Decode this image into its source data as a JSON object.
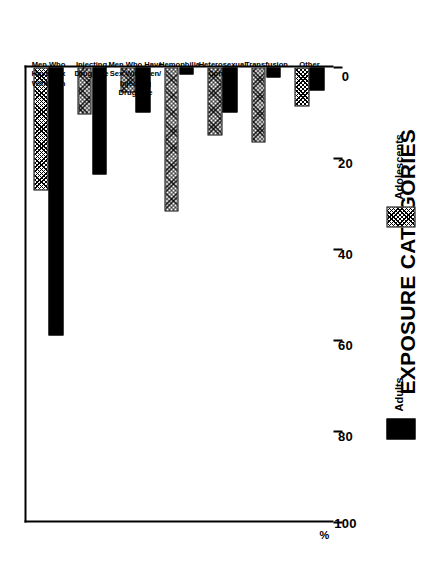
{
  "chart_data": {
    "type": "bar",
    "orientation": "horizontal",
    "title": "",
    "xlabel": "EXPOSURE CATEGORIES",
    "ylabel": "%",
    "ylim": [
      0,
      100
    ],
    "yticks": [
      0,
      20,
      40,
      60,
      80,
      100
    ],
    "ytick_labels": [
      "0",
      "20",
      "40",
      "60",
      "80",
      "100"
    ],
    "grid": false,
    "legend_position": "below-axis",
    "categories": [
      "Men Who\nHave Sex\nWith Men",
      "Injecting\nDrug Use",
      "Men Who Have\nSex With Men/\nInjecting\nDrug Use",
      "Hemophilia",
      "Heterosexual\nContact",
      "Transfusion",
      "Other"
    ],
    "category_lines": [
      [
        "Men Who",
        "Have Sex",
        "With Men"
      ],
      [
        "Injecting",
        "Drug Use"
      ],
      [
        "Men Who Have",
        "Sex With Men/",
        "Injecting",
        "Drug Use"
      ],
      [
        "Hemophilia"
      ],
      [
        "Heterosexual",
        "Contact"
      ],
      [
        "Transfusion"
      ],
      [
        "Other"
      ]
    ],
    "series": [
      {
        "name": "Adults",
        "color": "#000000",
        "pattern": "solid",
        "values": [
          59,
          23.5,
          9.8,
          1.6,
          9.8,
          2.2,
          5.1
        ]
      },
      {
        "name": "Adolescents",
        "color": "#000000",
        "pattern": "hatched",
        "values": [
          27,
          10.4,
          5.5,
          31.7,
          15.0,
          16.4,
          8.5
        ]
      }
    ]
  },
  "axis": {
    "value_axis_label": "%",
    "category_axis_title": "EXPOSURE CATEGORIES"
  },
  "legend": {
    "items": [
      {
        "label": "Adults",
        "swatch": "solid-black-swatch"
      },
      {
        "label": "Adolescents",
        "swatch": "hatched-swatch"
      }
    ]
  }
}
